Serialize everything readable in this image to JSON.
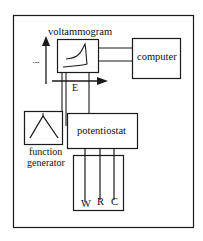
{
  "diagram": {
    "labels": {
      "voltammogram": "voltammogram",
      "computer": "computer",
      "potentiostat": "potentiostat",
      "function_generator_line1": "function",
      "function_generator_line2": "generator",
      "current_axis": "i",
      "potential_axis": "E",
      "electrode_working": "W",
      "electrode_reference": "R",
      "electrode_counter": "C"
    },
    "colors": {
      "line": "#1a1a1a",
      "background": "#ffffff"
    }
  }
}
